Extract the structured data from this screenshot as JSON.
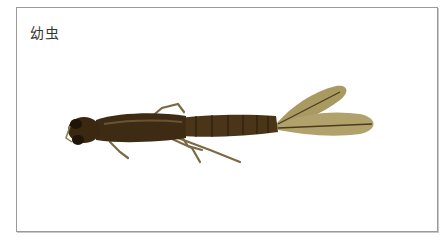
{
  "figure": {
    "caption": "幼虫",
    "colors": {
      "frame_border": "#9a9a9a",
      "body_dark": "#3a2a14",
      "body_mid": "#5a4424",
      "gill": "#a99a62",
      "gill_vein": "#4a3a20",
      "leg": "#7a6a44"
    }
  }
}
